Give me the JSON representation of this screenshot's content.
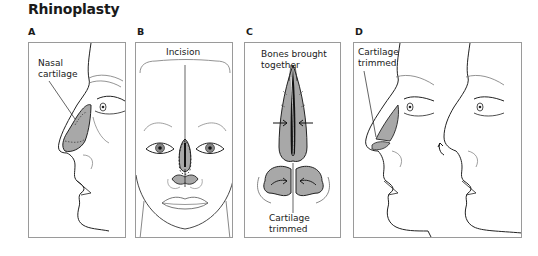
{
  "figure": {
    "title": "Rhinoplasty",
    "colors": {
      "cartilage_fill": "#a8a8a8",
      "line": "#222222",
      "border": "#9a9a9a"
    },
    "panels": [
      {
        "letter": "A",
        "callouts": [
          "Nasal",
          "cartilage"
        ]
      },
      {
        "letter": "B",
        "callouts": [
          "Incision"
        ]
      },
      {
        "letter": "C",
        "callouts_top": [
          "Bones brought",
          "together"
        ],
        "callouts_bottom": [
          "Cartilage",
          "trimmed"
        ]
      },
      {
        "letter": "D",
        "callouts": [
          "Cartilage",
          "trimmed"
        ]
      }
    ]
  }
}
